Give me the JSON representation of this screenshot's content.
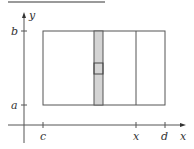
{
  "figure": {
    "type": "region-of-integration-diagram",
    "axes": {
      "x_label": "x",
      "y_label": "y"
    },
    "x_ticks": [
      {
        "label": "c",
        "value": "c"
      },
      {
        "label": "x",
        "value": "x"
      },
      {
        "label": "d",
        "value": "d"
      }
    ],
    "y_ticks": [
      {
        "label": "a",
        "value": "a"
      },
      {
        "label": "b",
        "value": "b"
      }
    ],
    "colors": {
      "strip_fill": "#d4d4d4",
      "line": "#555555",
      "top_bar": "#9a9a9a"
    }
  }
}
